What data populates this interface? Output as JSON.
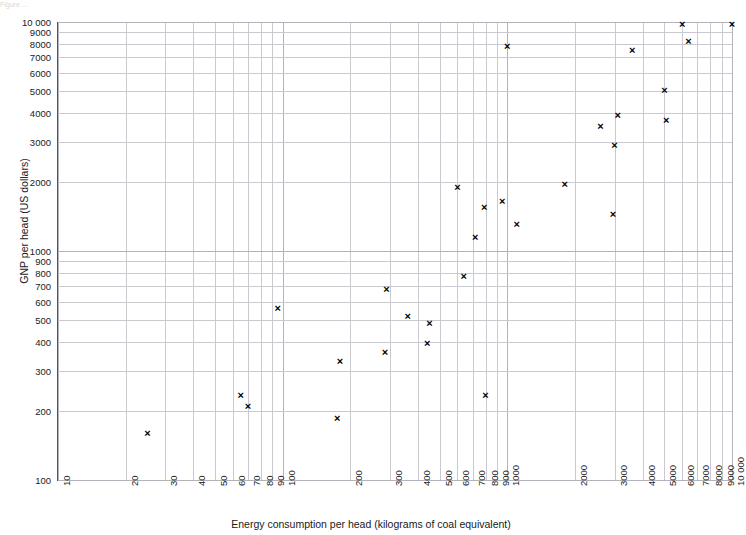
{
  "figure": {
    "top_note": "Figure ...",
    "background": "#ffffff",
    "marker_color": "#000000",
    "grid_color": "#c9c9cf",
    "axis_color": "#555555"
  },
  "chart_data": {
    "type": "scatter",
    "title": "",
    "xlabel": "Energy consumption per head (kilograms of coal equivalent)",
    "ylabel": "GNP per head (US dollars)",
    "xscale": "log",
    "yscale": "log",
    "xlim": [
      10,
      10000
    ],
    "ylim": [
      100,
      10000
    ],
    "grid": true,
    "legend": "none",
    "xticks": [
      10,
      20,
      30,
      40,
      50,
      60,
      70,
      80,
      90,
      100,
      200,
      300,
      400,
      500,
      600,
      700,
      800,
      900,
      1000,
      2000,
      3000,
      4000,
      5000,
      6000,
      7000,
      8000,
      9000,
      10000
    ],
    "xtick_labels": [
      "10",
      "20",
      "30",
      "40",
      "50",
      "60",
      "70",
      "80",
      "90",
      "100",
      "200",
      "300",
      "400",
      "500",
      "600",
      "700",
      "800",
      "900",
      "1000",
      "2000",
      "3000",
      "4000",
      "5000",
      "6000",
      "7000",
      "8000",
      "9000",
      "10 000"
    ],
    "yticks": [
      100,
      200,
      300,
      400,
      500,
      600,
      700,
      800,
      900,
      1000,
      2000,
      3000,
      4000,
      5000,
      6000,
      7000,
      8000,
      9000,
      10000
    ],
    "ytick_labels": [
      "100",
      "200",
      "300",
      "400",
      "500",
      "600",
      "700",
      "800",
      "900",
      "1000",
      "2000",
      "3000",
      "4000",
      "5000",
      "6000",
      "7000",
      "8000",
      "9000",
      "10 000"
    ],
    "marker": "x",
    "points": [
      {
        "x": 25,
        "y": 160
      },
      {
        "x": 65,
        "y": 235
      },
      {
        "x": 70,
        "y": 210
      },
      {
        "x": 95,
        "y": 560
      },
      {
        "x": 175,
        "y": 185
      },
      {
        "x": 180,
        "y": 330
      },
      {
        "x": 285,
        "y": 360
      },
      {
        "x": 290,
        "y": 680
      },
      {
        "x": 360,
        "y": 520
      },
      {
        "x": 440,
        "y": 395
      },
      {
        "x": 450,
        "y": 480
      },
      {
        "x": 600,
        "y": 1900
      },
      {
        "x": 640,
        "y": 770
      },
      {
        "x": 720,
        "y": 1150
      },
      {
        "x": 790,
        "y": 1550
      },
      {
        "x": 800,
        "y": 235
      },
      {
        "x": 950,
        "y": 1650
      },
      {
        "x": 1000,
        "y": 7800
      },
      {
        "x": 1100,
        "y": 1300
      },
      {
        "x": 1800,
        "y": 1950
      },
      {
        "x": 2600,
        "y": 3500
      },
      {
        "x": 2950,
        "y": 1450
      },
      {
        "x": 3000,
        "y": 2900
      },
      {
        "x": 3100,
        "y": 3900
      },
      {
        "x": 3600,
        "y": 7500
      },
      {
        "x": 5000,
        "y": 5000
      },
      {
        "x": 5100,
        "y": 3700
      },
      {
        "x": 6000,
        "y": 9800
      },
      {
        "x": 6400,
        "y": 8200
      },
      {
        "x": 10000,
        "y": 9800
      }
    ]
  }
}
